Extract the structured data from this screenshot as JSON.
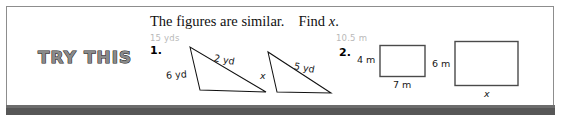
{
  "badge": {
    "label": "TRY THIS"
  },
  "heading": {
    "instruction": "The figures are similar.",
    "task_prefix": "Find ",
    "task_var": "x",
    "task_suffix": "."
  },
  "problems": [
    {
      "number": "1.",
      "ghost_label": "15 yds",
      "figures": [
        {
          "shape": "triangle",
          "role": "large",
          "labels": [
            {
              "text": "6 yd",
              "side": "left"
            },
            {
              "text": "2 yd",
              "side": "hypotenuse"
            }
          ]
        },
        {
          "shape": "triangle",
          "role": "small",
          "labels": [
            {
              "text": "x",
              "side": "left",
              "unknown": true
            },
            {
              "text": "5 yd",
              "side": "hypotenuse"
            }
          ]
        }
      ]
    },
    {
      "number": "2.",
      "ghost_label": "10.5 m",
      "figures": [
        {
          "shape": "rectangle",
          "role": "small",
          "labels": [
            {
              "text": "4 m",
              "side": "height"
            },
            {
              "text": "7 m",
              "side": "width"
            }
          ]
        },
        {
          "shape": "rectangle",
          "role": "large",
          "labels": [
            {
              "text": "6 m",
              "side": "height"
            },
            {
              "text": "x",
              "side": "width",
              "unknown": true
            }
          ]
        }
      ]
    }
  ],
  "colors": {
    "ink": "#111111",
    "ghost": "#b9b9b9",
    "rule": "#575757",
    "frame": "#8d8d8d",
    "badge_fill": "#8a8a8a",
    "badge_stroke": "#1a1a1a"
  }
}
